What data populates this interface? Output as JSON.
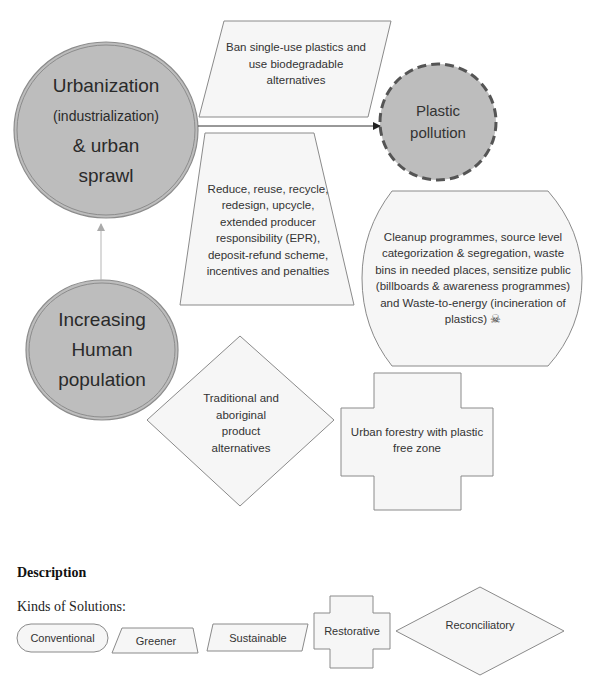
{
  "causes": {
    "urbanization": {
      "line1": "Urbanization",
      "line2": "(industrialization)",
      "line3": "& urban",
      "line4": "sprawl"
    },
    "population": {
      "line1": "Increasing",
      "line2": "Human",
      "line3": "population"
    }
  },
  "problem": {
    "line1": "Plastic",
    "line2": "pollution"
  },
  "solutions": {
    "ban_plastics": {
      "kind": "Sustainable",
      "text": "Ban single-use plastics and use biodegradable alternatives"
    },
    "reduce_reuse": {
      "kind": "Greener",
      "text": "Reduce, reuse, recycle, redesign, upcycle, extended producer responsibility (EPR), deposit-refund scheme, incentives and penalties"
    },
    "cleanup": {
      "kind": "Conventional",
      "text": "Cleanup programmes, source level categorization & segregation, waste bins in needed places, sensitize public (billboards & awareness programmes) and Waste-to-energy (incineration of plastics) ☠"
    },
    "traditional": {
      "kind": "Reconciliatory",
      "text": "Traditional and aboriginal product alternatives"
    },
    "urban_forestry": {
      "kind": "Restorative",
      "text": "Urban forestry with plastic free zone"
    }
  },
  "description": {
    "heading": "Description",
    "subheading": "Kinds of Solutions:",
    "legend": [
      {
        "label": "Conventional",
        "shape": "rounded-rectangle"
      },
      {
        "label": "Greener",
        "shape": "trapezoid"
      },
      {
        "label": "Sustainable",
        "shape": "parallelogram"
      },
      {
        "label": "Restorative",
        "shape": "cross"
      },
      {
        "label": "Reconciliatory",
        "shape": "diamond"
      }
    ]
  },
  "colors": {
    "circle_fill": "#bdbdbd",
    "circle_stroke": "#8c8c8c",
    "shape_fill": "#f6f6f6",
    "shape_stroke": "#8a8a8a",
    "dashed_stroke": "#555555",
    "arrow": "#333333"
  }
}
